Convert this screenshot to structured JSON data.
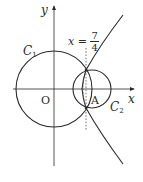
{
  "diagram": {
    "axes": {
      "x_label": "x",
      "y_label": "y",
      "origin_label": "O"
    },
    "curves": {
      "c1": {
        "name": "C",
        "subscript": "1"
      },
      "c2": {
        "name": "C",
        "subscript": "2"
      },
      "hyperbola": {
        "name": "hyperbola"
      }
    },
    "points": {
      "a": {
        "label": "A"
      }
    },
    "line": {
      "equation_lhs": "x =",
      "numerator": "7",
      "denominator": "4"
    },
    "colors": {
      "stroke": "#2a2a2a",
      "dashed": "#555555",
      "background": "#ffffff"
    }
  }
}
